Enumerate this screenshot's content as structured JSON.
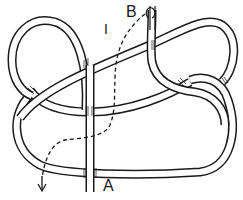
{
  "diagram": {
    "type": "knot-tying-illustration",
    "labels": {
      "end_b": "B",
      "end_a": "A",
      "step_marker": "I"
    },
    "colors": {
      "line": "#1a1a1a",
      "background": "#ffffff"
    },
    "elements": [
      "rope loop (left upper bight)",
      "rope loop (right upper bight)",
      "rope lower loop",
      "vertical standing part ending at A",
      "dashed path showing working end direction from B",
      "direction arrow (down, lower left)"
    ]
  }
}
